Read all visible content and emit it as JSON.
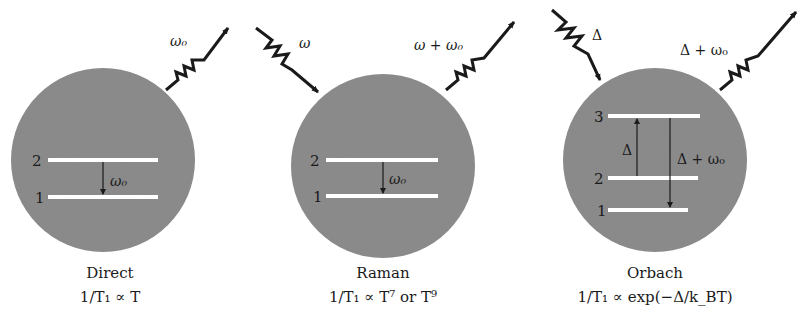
{
  "panels": [
    {
      "name": "Direct",
      "formula": "1/T₁ ∝ T",
      "incoming_phonon": null,
      "outgoing_phonon": "ω₀",
      "levels": [
        {
          "label": "2"
        },
        {
          "label": "1"
        }
      ],
      "transitions": [
        {
          "from": "2",
          "to": "1",
          "label": "ω₀"
        }
      ]
    },
    {
      "name": "Raman",
      "formula": "1/T₁ ∝ T⁷ or T⁹",
      "incoming_phonon": "ω",
      "outgoing_phonon": "ω + ω₀",
      "levels": [
        {
          "label": "2"
        },
        {
          "label": "1"
        }
      ],
      "transitions": [
        {
          "from": "2",
          "to": "1",
          "label": "ω₀"
        }
      ]
    },
    {
      "name": "Orbach",
      "formula": "1/T₁ ∝ exp(−Δ/k_BT)",
      "incoming_phonon": "Δ",
      "outgoing_phonon": "Δ + ω₀",
      "levels": [
        {
          "label": "3"
        },
        {
          "label": "2"
        },
        {
          "label": "1"
        }
      ],
      "transitions": [
        {
          "from": "2",
          "to": "3",
          "label": "Δ"
        },
        {
          "from": "3",
          "to": "1",
          "label": "Δ + ω₀"
        }
      ]
    }
  ],
  "colors": {
    "sphere": "#8c8c8c",
    "level_line": "#ffffff",
    "ink": "#1a1a1a"
  }
}
